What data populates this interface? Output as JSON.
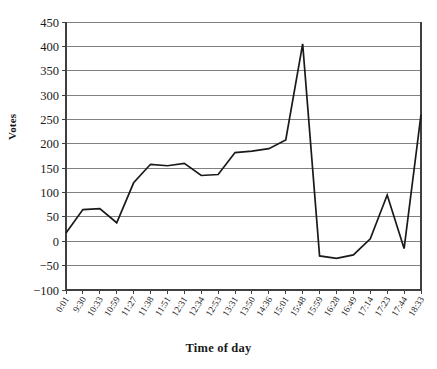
{
  "chart_data": {
    "type": "line",
    "title": "",
    "xlabel": "Time of day",
    "ylabel": "Votes",
    "grid": true,
    "legend": null,
    "ylim": [
      -100,
      450
    ],
    "ytick_step": 50,
    "yticks": [
      "450",
      "400",
      "350",
      "300",
      "250",
      "200",
      "150",
      "100",
      "50",
      "0",
      "-50",
      "-100"
    ],
    "categories": [
      "0:01",
      "9:30",
      "10:33",
      "10:59",
      "11:27",
      "11:38",
      "11:51",
      "12:31",
      "12:34",
      "12:53",
      "13:31",
      "13:50",
      "14:36",
      "15:01",
      "15:48",
      "15:59",
      "16:28",
      "16:49",
      "17:14",
      "17:23",
      "17:44",
      "18:33"
    ],
    "values": [
      17,
      65,
      67,
      38,
      120,
      158,
      155,
      160,
      135,
      137,
      182,
      185,
      190,
      208,
      405,
      -30,
      -35,
      -28,
      5,
      95,
      -15,
      260
    ],
    "series": [
      {
        "name": "Votes",
        "color": "#1a1a1a",
        "values": [
          17,
          65,
          67,
          38,
          120,
          158,
          155,
          160,
          135,
          137,
          182,
          185,
          190,
          208,
          405,
          -30,
          -35,
          -28,
          5,
          95,
          -15,
          260
        ]
      }
    ],
    "notes": {
      "peak_label": "405",
      "peak_time": "15:48",
      "min_label": "-35",
      "min_time": "16:28",
      "final_label": "260",
      "final_time": "18:33"
    }
  },
  "axis": {
    "y_title": "Votes",
    "x_title": "Time of day"
  },
  "colors": {
    "line": "#1a1a1a",
    "grid": "#808080",
    "axis": "#404040",
    "background": "#ffffff"
  }
}
